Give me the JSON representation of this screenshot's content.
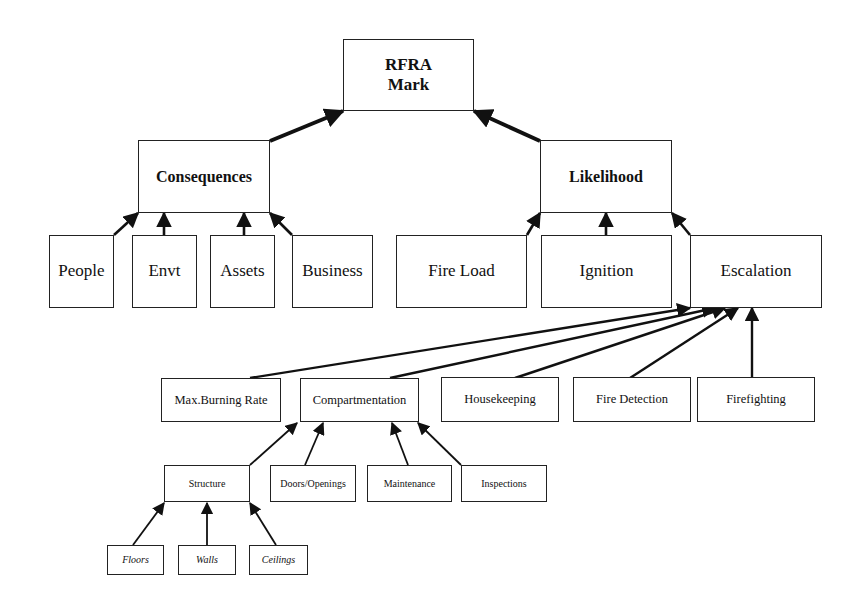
{
  "diagram": {
    "title": "RFRA Mark",
    "colors": {
      "stroke": "#222222",
      "background": "#ffffff",
      "text": "#111111"
    },
    "nodes": {
      "rfra": {
        "label": "RFRA\nMark",
        "line1": "RFRA",
        "line2": "Mark"
      },
      "consequences": {
        "label": "Consequences"
      },
      "likelihood": {
        "label": "Likelihood"
      },
      "people": {
        "label": "People"
      },
      "envt": {
        "label": "Envt"
      },
      "assets": {
        "label": "Assets"
      },
      "business": {
        "label": "Business"
      },
      "fire_load": {
        "label": "Fire Load"
      },
      "ignition": {
        "label": "Ignition"
      },
      "escalation": {
        "label": "Escalation"
      },
      "max_burning_rate": {
        "label": "Max.Burning Rate"
      },
      "compartmentation": {
        "label": "Compartmentation"
      },
      "housekeeping": {
        "label": "Housekeeping"
      },
      "fire_detection": {
        "label": "Fire Detection"
      },
      "firefighting": {
        "label": "Firefighting"
      },
      "structure": {
        "label": "Structure"
      },
      "doors_openings": {
        "label": "Doors/Openings"
      },
      "maintenance": {
        "label": "Maintenance"
      },
      "inspections": {
        "label": "Inspections"
      },
      "floors": {
        "label": "Floors"
      },
      "walls": {
        "label": "Walls"
      },
      "ceilings": {
        "label": "Ceilings"
      }
    },
    "edges": [
      {
        "from": "Consequences",
        "to": "RFRA Mark"
      },
      {
        "from": "Likelihood",
        "to": "RFRA Mark"
      },
      {
        "from": "People",
        "to": "Consequences"
      },
      {
        "from": "Envt",
        "to": "Consequences"
      },
      {
        "from": "Assets",
        "to": "Consequences"
      },
      {
        "from": "Business",
        "to": "Consequences"
      },
      {
        "from": "Fire Load",
        "to": "Likelihood"
      },
      {
        "from": "Ignition",
        "to": "Likelihood"
      },
      {
        "from": "Escalation",
        "to": "Likelihood"
      },
      {
        "from": "Max.Burning Rate",
        "to": "Escalation"
      },
      {
        "from": "Compartmentation",
        "to": "Escalation"
      },
      {
        "from": "Housekeeping",
        "to": "Escalation"
      },
      {
        "from": "Fire Detection",
        "to": "Escalation"
      },
      {
        "from": "Firefighting",
        "to": "Escalation"
      },
      {
        "from": "Structure",
        "to": "Compartmentation"
      },
      {
        "from": "Doors/Openings",
        "to": "Compartmentation"
      },
      {
        "from": "Maintenance",
        "to": "Compartmentation"
      },
      {
        "from": "Inspections",
        "to": "Compartmentation"
      },
      {
        "from": "Floors",
        "to": "Structure"
      },
      {
        "from": "Walls",
        "to": "Structure"
      },
      {
        "from": "Ceilings",
        "to": "Structure"
      }
    ]
  }
}
